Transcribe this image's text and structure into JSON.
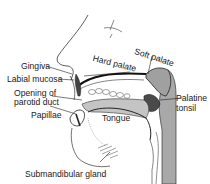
{
  "labels": {
    "gingiva": "Gingiva",
    "labial_mucosa": "Labial mucosa",
    "opening_line1": "Opening of",
    "opening_line2": "parotid duct",
    "papillae": "Papillae",
    "tongue": "Tongue",
    "hard_palate": "Hard palate",
    "soft_palate": "Soft palate",
    "palatine_line1": "Palatine",
    "palatine_line2": "tonsil",
    "submandibular": "Submandibular gland"
  },
  "colors": {
    "ink": "#1a1a1a",
    "tissue_gray": "#a8a8a8",
    "light_gray": "#cfcfcf",
    "background": "#ffffff"
  }
}
